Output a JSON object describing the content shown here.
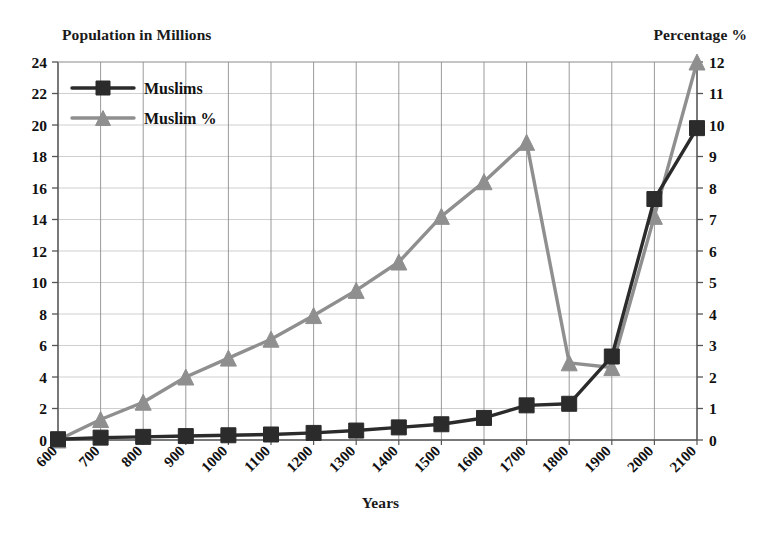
{
  "chart_data": {
    "type": "line",
    "title": "",
    "xlabel": "Years",
    "ylabel": "Population in Millions",
    "y2label": "Percentage %",
    "grid": true,
    "legend_position": "top-left",
    "categories": [
      "600",
      "700",
      "800",
      "900",
      "1000",
      "1100",
      "1200",
      "1300",
      "1400",
      "1500",
      "1600",
      "1700",
      "1800",
      "1900",
      "2000",
      "2100"
    ],
    "ylim": [
      0,
      24
    ],
    "yticks": [
      0,
      2,
      4,
      6,
      8,
      10,
      12,
      14,
      16,
      18,
      20,
      22,
      24
    ],
    "y2lim": [
      0,
      12
    ],
    "y2ticks": [
      0,
      1,
      2,
      3,
      4,
      5,
      6,
      7,
      8,
      9,
      10,
      11,
      12
    ],
    "series": [
      {
        "name": "Muslims",
        "axis": "left",
        "unit": "millions",
        "color": "#2b2b2b",
        "marker": "square",
        "values": [
          0.05,
          0.15,
          0.2,
          0.25,
          0.3,
          0.35,
          0.45,
          0.6,
          0.8,
          1.0,
          1.4,
          2.2,
          2.3,
          5.3,
          15.3,
          19.8
        ]
      },
      {
        "name": "Muslim %",
        "axis": "right",
        "unit": "percent",
        "color": "#8f8f8f",
        "marker": "triangle",
        "values": [
          0.0,
          1.3,
          2.4,
          4.0,
          5.2,
          6.4,
          7.9,
          9.5,
          11.3,
          14.2,
          16.4,
          18.9,
          4.9,
          4.6,
          14.2,
          24.0
        ]
      }
    ],
    "series_right_percent": [
      0.0,
      0.65,
      1.2,
      2.0,
      2.6,
      3.2,
      3.95,
      4.75,
      5.65,
      7.1,
      8.2,
      9.45,
      2.45,
      2.3,
      7.1,
      12.0
    ]
  },
  "legend": {
    "entries": [
      {
        "label": "Muslims",
        "marker": "square",
        "color": "#2b2b2b"
      },
      {
        "label": "Muslim %",
        "marker": "triangle",
        "color": "#8f8f8f"
      }
    ]
  },
  "labels": {
    "left_axis_title": "Population in Millions",
    "right_axis_title": "Percentage %",
    "x_axis_title": "Years"
  }
}
